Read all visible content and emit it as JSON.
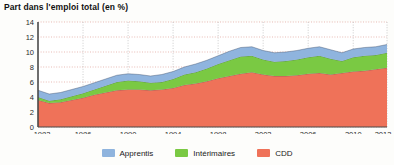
{
  "chart_data": {
    "type": "area",
    "title": "Part dans l'emploi total (en %)",
    "xlabel": "",
    "ylabel": "",
    "stacked": true,
    "grid": true,
    "legend_position": "bottom",
    "xlim": [
      1982,
      2013
    ],
    "ylim": [
      0,
      14
    ],
    "yticks": [
      0,
      2,
      4,
      6,
      8,
      10,
      12,
      14
    ],
    "xticks": [
      1982,
      1986,
      1990,
      1994,
      1998,
      2002,
      2006,
      2010,
      2013
    ],
    "x": [
      1982,
      1983,
      1984,
      1985,
      1986,
      1987,
      1988,
      1989,
      1990,
      1991,
      1992,
      1993,
      1994,
      1995,
      1996,
      1997,
      1998,
      1999,
      2000,
      2001,
      2002,
      2003,
      2004,
      2005,
      2006,
      2007,
      2008,
      2009,
      2010,
      2011,
      2012,
      2013
    ],
    "series": [
      {
        "name": "CDD",
        "color": "#ef7259",
        "values": [
          3.6,
          3.2,
          3.3,
          3.6,
          3.9,
          4.3,
          4.6,
          4.9,
          5.0,
          5.0,
          4.9,
          5.0,
          5.2,
          5.6,
          5.8,
          6.1,
          6.5,
          6.8,
          7.1,
          7.3,
          7.0,
          6.8,
          6.8,
          6.9,
          7.1,
          7.2,
          7.0,
          7.2,
          7.4,
          7.5,
          7.7,
          7.9
        ]
      },
      {
        "name": "Intérimaires",
        "color": "#7ac943",
        "values": [
          0.4,
          0.3,
          0.4,
          0.5,
          0.6,
          0.7,
          0.9,
          1.1,
          1.2,
          1.1,
          1.0,
          1.0,
          1.2,
          1.4,
          1.5,
          1.7,
          1.9,
          2.1,
          2.3,
          2.2,
          2.0,
          1.9,
          2.0,
          2.1,
          2.2,
          2.3,
          2.1,
          1.6,
          1.9,
          2.0,
          1.9,
          2.0
        ]
      },
      {
        "name": "Apprentis",
        "color": "#8fb4de",
        "values": [
          0.9,
          0.9,
          0.9,
          0.9,
          0.9,
          0.9,
          0.9,
          0.9,
          0.9,
          0.9,
          0.9,
          1.0,
          1.0,
          1.0,
          1.1,
          1.1,
          1.1,
          1.2,
          1.2,
          1.2,
          1.2,
          1.2,
          1.2,
          1.2,
          1.2,
          1.2,
          1.2,
          1.1,
          1.1,
          1.1,
          1.1,
          1.1
        ]
      }
    ],
    "totals": [
      4.9,
      4.4,
      4.6,
      5.0,
      5.4,
      5.9,
      6.4,
      6.9,
      7.1,
      7.0,
      6.8,
      7.0,
      7.4,
      8.0,
      8.4,
      8.9,
      9.5,
      10.1,
      10.6,
      10.7,
      10.2,
      9.9,
      10.0,
      10.2,
      10.5,
      10.7,
      10.3,
      9.9,
      10.4,
      10.6,
      10.7,
      11.0
    ]
  },
  "legend": {
    "items": [
      {
        "label": "Apprentis",
        "color": "#8fb4de"
      },
      {
        "label": "Intérimaires",
        "color": "#7ac943"
      },
      {
        "label": "CDD",
        "color": "#ef7259"
      }
    ]
  },
  "axes": {
    "y_labels": [
      "14",
      "12",
      "10",
      "8",
      "6",
      "4",
      "2",
      "0"
    ],
    "x_labels": [
      "1982",
      "1986",
      "1990",
      "1994",
      "1998",
      "2002",
      "2006",
      "2010",
      "2013"
    ]
  },
  "colors": {
    "cdd": "#ef7259",
    "interimaires": "#7ac943",
    "apprentis": "#8fb4de",
    "axis": "#555555",
    "grid": "#d9534f"
  }
}
